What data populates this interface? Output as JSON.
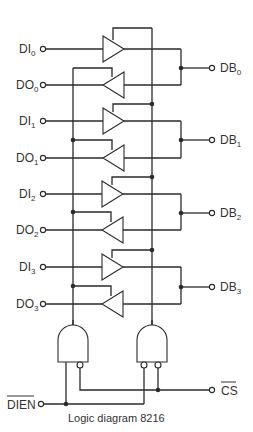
{
  "diagram": {
    "caption": "Logic diagram 8216",
    "inputs_left": [
      {
        "name": "DI",
        "sub": "0"
      },
      {
        "name": "DO",
        "sub": "0"
      },
      {
        "name": "DI",
        "sub": "1"
      },
      {
        "name": "DO",
        "sub": "1"
      },
      {
        "name": "DI",
        "sub": "2"
      },
      {
        "name": "DO",
        "sub": "2"
      },
      {
        "name": "DI",
        "sub": "3"
      },
      {
        "name": "DO",
        "sub": "3"
      }
    ],
    "bus_right": [
      {
        "name": "DB",
        "sub": "0"
      },
      {
        "name": "DB",
        "sub": "1"
      },
      {
        "name": "DB",
        "sub": "2"
      },
      {
        "name": "DB",
        "sub": "3"
      }
    ],
    "control": {
      "dien": "DIEN",
      "cs": "CS"
    },
    "colors": {
      "line": "#2a2a2a",
      "text": "#333333",
      "background": "#ffffff"
    }
  }
}
